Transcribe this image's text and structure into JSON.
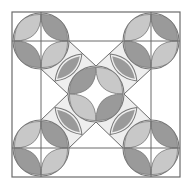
{
  "diagram": {
    "kind": "quilt-block-pattern",
    "width": 192,
    "height": 183,
    "colors": {
      "background": "#ffffff",
      "outline": "#6b6b6b",
      "band_fill": "#eeeeee",
      "lens_light": "#c8c8c8",
      "lens_dark": "#9a9a9a",
      "circle_outline": "#777777"
    },
    "outer_square": {
      "x": 12,
      "y": 12,
      "w": 168,
      "h": 165
    },
    "grid_lines": {
      "vertical_x": [
        41,
        151
      ],
      "horizontal_y": [
        41,
        148
      ]
    },
    "corner_circles": [
      {
        "id": "top-left",
        "cx": 41,
        "cy": 41,
        "r": 28
      },
      {
        "id": "top-right",
        "cx": 151,
        "cy": 41,
        "r": 28
      },
      {
        "id": "bottom-left",
        "cx": 41,
        "cy": 148,
        "r": 28
      },
      {
        "id": "bottom-right",
        "cx": 151,
        "cy": 148,
        "r": 28
      }
    ],
    "center_circle": {
      "id": "center",
      "cx": 96,
      "cy": 94,
      "r": 28
    },
    "diagonal_bands": [
      "top-left",
      "top-right",
      "bottom-left",
      "bottom-right"
    ]
  }
}
